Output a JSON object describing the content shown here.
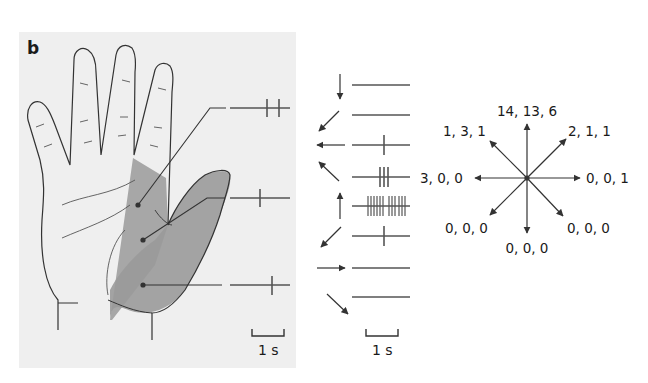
{
  "panel_b": {
    "label": "b",
    "traces": [
      {
        "name": "receptor-1",
        "y": 108,
        "spikes": [
          272,
          282
        ]
      },
      {
        "name": "receptor-2",
        "y": 198,
        "spikes": [
          260
        ]
      },
      {
        "name": "receptor-3",
        "y": 285,
        "spikes": [
          272
        ]
      }
    ],
    "scale_bar": "1 s"
  },
  "panel_c": {
    "label": "c",
    "rows": [
      {
        "direction": "down",
        "spike_count": 0
      },
      {
        "direction": "down-left",
        "spike_count": 0
      },
      {
        "direction": "left",
        "spike_count": 1
      },
      {
        "direction": "up-left",
        "spike_count": 3
      },
      {
        "direction": "up",
        "spike_count": 12
      },
      {
        "direction": "down-left",
        "spike_count": 1
      },
      {
        "direction": "right",
        "spike_count": 0
      },
      {
        "direction": "down-right",
        "spike_count": 0
      }
    ],
    "scale_bar": "1 s",
    "star": {
      "up": "14, 13, 6",
      "up_left": "1, 3, 1",
      "up_right": "2, 1, 1",
      "left": "3, 0, 0",
      "right": "0, 0, 1",
      "down_left": "0, 0, 0",
      "down": "0, 0, 0",
      "down_right": "0, 0, 0"
    }
  },
  "colors": {
    "background": "#efefef",
    "shade": "#9a9a9a",
    "ink": "#333333",
    "trace": "#555555"
  }
}
